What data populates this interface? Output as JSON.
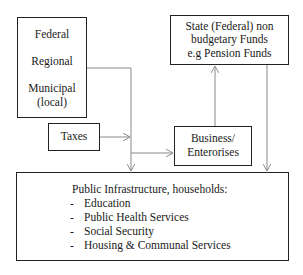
{
  "diagram": {
    "government_levels": {
      "items": [
        "Federal",
        "Regional",
        "Municipal",
        "(local)"
      ]
    },
    "taxes": {
      "label": "Taxes"
    },
    "state_funds": {
      "lines": [
        "State (Federal) non",
        "budgetary Funds",
        "e.g Pension Funds"
      ]
    },
    "business": {
      "lines": [
        "Business/",
        "Enterorises"
      ]
    },
    "public": {
      "title": "Public Infrastructure, households:",
      "bullet": "-",
      "items": [
        "Education",
        "Public Health Services",
        "Social Security",
        "Housing & Communal Services"
      ]
    },
    "colors": {
      "box_border": "#222222",
      "arrow": "#8a8a8a",
      "text": "#1a1a1a"
    }
  }
}
